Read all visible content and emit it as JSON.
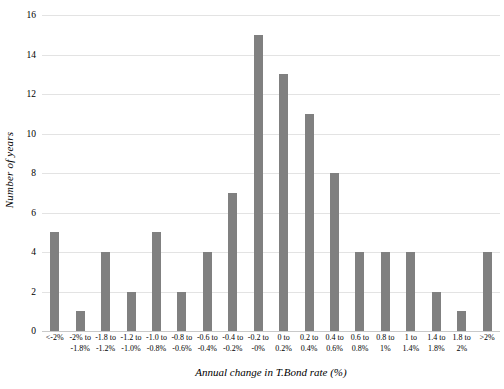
{
  "chart_data": {
    "type": "bar",
    "title": "",
    "xlabel": "Annual change in T.Bond rate (%)",
    "ylabel": "Number of years",
    "ylim": [
      0,
      16
    ],
    "yticks": [
      0,
      2,
      4,
      6,
      8,
      10,
      12,
      14,
      16
    ],
    "grid": true,
    "legend": "none",
    "bar_color": "#808080",
    "gridline_color": "#e3e3e3",
    "categories": [
      "<-2%",
      "-2% to\n-1.8%",
      "-1.8 to\n-1.2%",
      "-1.2 to\n-1.0%",
      "-1.0 to\n-0.8%",
      "-0.8 to\n-0.6%",
      "-0.6 to\n-0.4%",
      "-0.4 to\n-0.2%",
      "-0.2 to\n-0%",
      "0 to\n0.2%",
      "0.2 to\n0.4%",
      "0.4 to\n0.6%",
      "0.6 to\n0.8%",
      "0.8 to\n1%",
      "1 to\n1.4%",
      "1.4 to\n1.8%",
      "1.8 to\n2%",
      ">2%"
    ],
    "values": [
      5,
      1,
      4,
      2,
      5,
      2,
      4,
      7,
      15,
      13,
      11,
      8,
      4,
      4,
      4,
      2,
      1,
      4
    ]
  }
}
